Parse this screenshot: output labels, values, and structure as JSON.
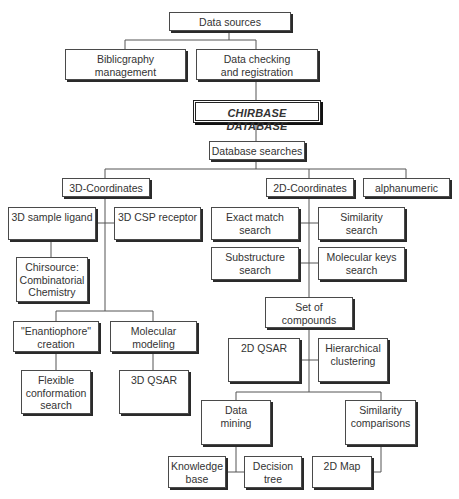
{
  "diagram": {
    "title": "CHIRBASE DATABASE",
    "nodes": {
      "data_sources": "Data sources",
      "bibliography": "Biblicgraphy\nmanagement",
      "data_checking": "Data checking\nand registration",
      "chirbase": "CHIRBASE DATABASE",
      "database_searches": "Database searches",
      "coords_3d": "3D-Coordinates",
      "coords_2d": "2D-Coordinates",
      "alphanumeric": "alphanumeric",
      "sample_ligand_3d": "3D sample ligand",
      "csp_receptor_3d": "3D CSP receptor",
      "chirsource": "Chirsource:\nCombinatorial\nChemistry",
      "enantiophore": "\"Enantiophore\"\ncreation",
      "molecular_modeling": "Molecular\nmodeling",
      "flexible_conformation": "Flexible\nconformation\nsearch",
      "qsar_3d": "3D QSAR",
      "exact_match": "Exact match\nsearch",
      "similarity_search": "Similarity\nsearch",
      "substructure": "Substructure\nsearch",
      "molecular_keys": "Molecular keys\nsearch",
      "set_of_compounds": "Set of\ncompounds",
      "qsar_2d": "2D QSAR",
      "hierarchical_clustering": "Hierarchical\nclustering",
      "data_mining": "Data\nmining",
      "similarity_comparisons": "Similarity\ncomparisons",
      "knowledge_base": "Knowledge\nbase",
      "decision_tree": "Decision\ntree",
      "map_2d": "2D Map"
    },
    "edges": [
      [
        "data_sources",
        "bibliography"
      ],
      [
        "data_sources",
        "data_checking"
      ],
      [
        "data_checking",
        "chirbase"
      ],
      [
        "chirbase",
        "database_searches"
      ],
      [
        "database_searches",
        "coords_3d"
      ],
      [
        "database_searches",
        "coords_2d"
      ],
      [
        "database_searches",
        "alphanumeric"
      ],
      [
        "coords_3d",
        "sample_ligand_3d"
      ],
      [
        "coords_3d",
        "csp_receptor_3d"
      ],
      [
        "sample_ligand_3d",
        "chirsource"
      ],
      [
        "coords_3d",
        "enantiophore"
      ],
      [
        "coords_3d",
        "molecular_modeling"
      ],
      [
        "enantiophore",
        "flexible_conformation"
      ],
      [
        "molecular_modeling",
        "qsar_3d"
      ],
      [
        "coords_2d",
        "exact_match"
      ],
      [
        "coords_2d",
        "similarity_search"
      ],
      [
        "coords_2d",
        "substructure"
      ],
      [
        "coords_2d",
        "molecular_keys"
      ],
      [
        "coords_2d",
        "set_of_compounds"
      ],
      [
        "set_of_compounds",
        "qsar_2d"
      ],
      [
        "set_of_compounds",
        "hierarchical_clustering"
      ],
      [
        "set_of_compounds",
        "data_mining"
      ],
      [
        "set_of_compounds",
        "similarity_comparisons"
      ],
      [
        "data_mining",
        "knowledge_base"
      ],
      [
        "data_mining",
        "decision_tree"
      ],
      [
        "similarity_comparisons",
        "map_2d"
      ]
    ]
  }
}
